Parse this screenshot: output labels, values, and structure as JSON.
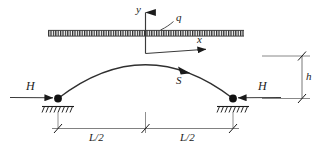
{
  "figure": {
    "background_color": "#ffffff",
    "line_color": "#3a3a3a",
    "ink_color": "#1b1b1b"
  },
  "axes": {
    "y_label": "y",
    "x_label": "x",
    "origin_label": ""
  },
  "load": {
    "label": "q",
    "type": "uniformly-distributed-load"
  },
  "arch": {
    "curve_label": "S",
    "shape": "parabola"
  },
  "forces": {
    "left": {
      "label": "H",
      "direction": "right"
    },
    "right": {
      "label": "H",
      "direction": "left"
    }
  },
  "supports": {
    "left": {
      "type": "pinned-hatched"
    },
    "right": {
      "type": "pinned-hatched"
    }
  },
  "dimensions": {
    "span_left": "L/2",
    "span_right": "L/2",
    "rise": "h"
  }
}
